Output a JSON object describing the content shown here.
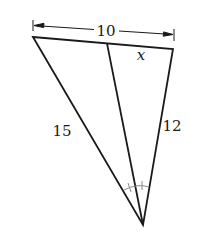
{
  "diagram": {
    "type": "triangle-angle-bisector",
    "vertices": {
      "top_left": {
        "x": 33,
        "y": 37
      },
      "top_right": {
        "x": 173,
        "y": 49
      },
      "bottom": {
        "x": 143,
        "y": 225
      },
      "bisector_foot": {
        "x": 107,
        "y": 43
      }
    },
    "labels": {
      "top_side_total": "10",
      "right_segment": "x",
      "left_side": "15",
      "right_side": "12"
    },
    "colors": {
      "line": "#1a1a1a",
      "angle_mark": "#8a8a8a",
      "background": "#ffffff"
    }
  }
}
